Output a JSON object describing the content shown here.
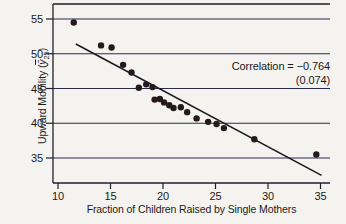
{
  "figure": {
    "y_axis_title": {
      "prefix": "Upward Mobility (",
      "var": "ȳ",
      "sub": "25",
      "suffix": ")"
    },
    "x_axis_title": "Fraction of Children Raised by Single Mothers",
    "annotation": {
      "line1": "Correlation = −0.764",
      "line2": "(0.074)"
    }
  },
  "chart_data": {
    "type": "scatter",
    "title": "",
    "xlabel": "Fraction of Children Raised by Single Mothers",
    "ylabel": "Upward Mobility (ȳ25)",
    "x_ticks": [
      10,
      15,
      20,
      25,
      30,
      35
    ],
    "y_ticks": [
      35,
      40,
      45,
      50,
      55
    ],
    "xlim": [
      9.5,
      36.0
    ],
    "ylim": [
      31.5,
      57.0
    ],
    "grid": "horizontal-only",
    "legend": "none",
    "annotation": {
      "label": "Correlation = −0.764 (0.074)",
      "correlation": -0.764,
      "std_error": 0.074
    },
    "points": [
      [
        11.5,
        54.5
      ],
      [
        14.1,
        51.2
      ],
      [
        15.1,
        50.9
      ],
      [
        16.2,
        48.4
      ],
      [
        17.0,
        47.3
      ],
      [
        17.7,
        45.1
      ],
      [
        18.4,
        45.6
      ],
      [
        19.0,
        45.2
      ],
      [
        19.2,
        43.4
      ],
      [
        19.7,
        43.5
      ],
      [
        20.1,
        43.0
      ],
      [
        20.6,
        42.6
      ],
      [
        21.0,
        42.2
      ],
      [
        21.7,
        42.3
      ],
      [
        22.3,
        41.6
      ],
      [
        23.2,
        40.7
      ],
      [
        24.3,
        40.2
      ],
      [
        25.1,
        39.9
      ],
      [
        25.8,
        39.3
      ],
      [
        28.7,
        37.7
      ],
      [
        34.6,
        35.5
      ]
    ],
    "trendline": {
      "x1": 11.7,
      "y1": 51.4,
      "x2": 35.1,
      "y2": 32.5
    },
    "colors": {
      "background": "#f5f3ef",
      "axis": "#1f1f2e",
      "grid": "#2b2b4e",
      "dot": "#241a1c",
      "trend": "#1a1a24",
      "text": "#1a1a1a"
    }
  }
}
